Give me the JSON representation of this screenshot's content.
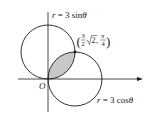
{
  "diagram": {
    "type": "polar-curves",
    "curves": [
      {
        "name": "top-circle",
        "equation_label": "r = 3 sinθ",
        "lhs": "r",
        "rhs": "= 3 sin",
        "theta": "θ"
      },
      {
        "name": "right-circle",
        "equation_label": "r = 3 cosθ",
        "lhs": "r",
        "rhs": "= 3 cos",
        "theta": "θ"
      }
    ],
    "intersection_point": {
      "label": "(3/2 √2, π/4)",
      "open": "(",
      "frac1_num": "3",
      "frac1_den": "2",
      "sqrt_arg": "2",
      "comma": ",",
      "frac2_num": "π",
      "frac2_den": "4",
      "close": ")"
    },
    "origin_label": "O",
    "shaded_region": "overlap of both circles",
    "colors": {
      "stroke": "#1a1a1a",
      "shade": "#c8c8c8",
      "background": "#ffffff"
    }
  }
}
